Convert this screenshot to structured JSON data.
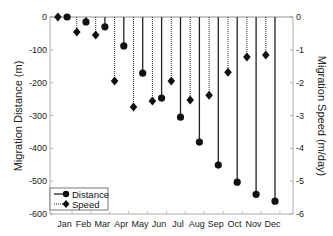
{
  "chart_data": {
    "type": "stem",
    "title": "",
    "xlabel": "",
    "categories": [
      "Jan",
      "Feb",
      "Mar",
      "Apr",
      "May",
      "Jun",
      "Jul",
      "Aug",
      "Sep",
      "Oct",
      "Nov",
      "Dec"
    ],
    "left_axis": {
      "label": "Migration Distance (m)",
      "ylim": [
        -600,
        0
      ],
      "ticks": [
        0,
        -100,
        -200,
        -300,
        -400,
        -500,
        -600
      ]
    },
    "right_axis": {
      "label": "Migration Speed (m/day)",
      "ylim": [
        -6,
        0
      ],
      "ticks": [
        0,
        -1,
        -2,
        -3,
        -4,
        -5,
        -6
      ]
    },
    "series": [
      {
        "name": "Distance",
        "axis": "left",
        "style": "solid",
        "marker": "circle",
        "values": [
          0,
          -15,
          -30,
          -88,
          -171,
          -247,
          -305,
          -381,
          -451,
          -503,
          -540,
          -561
        ]
      },
      {
        "name": "Speed",
        "axis": "right",
        "style": "dotted",
        "marker": "diamond",
        "values": [
          0,
          -0.46,
          -0.55,
          -1.95,
          -2.74,
          -2.56,
          -1.95,
          -2.53,
          -2.38,
          -1.68,
          -1.22,
          -1.16
        ]
      }
    ],
    "legend": {
      "position": "lower left",
      "entries": [
        "Distance",
        "Speed"
      ]
    },
    "grid": false
  }
}
